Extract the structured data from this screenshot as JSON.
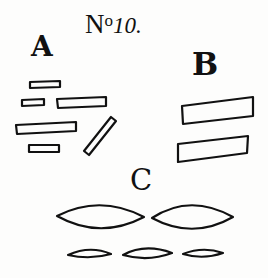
{
  "plate": {
    "title_prefix": "N",
    "title_superscript": "o",
    "title_number": "10.",
    "background": "#fdfdfc",
    "ink_color": "#111111"
  },
  "labels": {
    "a": "A",
    "b": "B",
    "c": "C"
  },
  "groups": [
    {
      "label": "A",
      "shape_type": "thin-rectangles",
      "count": 6
    },
    {
      "label": "B",
      "shape_type": "tilted-rectangles",
      "count": 2
    },
    {
      "label": "C",
      "shape_type": "lens-ellipses",
      "count": 5
    }
  ]
}
